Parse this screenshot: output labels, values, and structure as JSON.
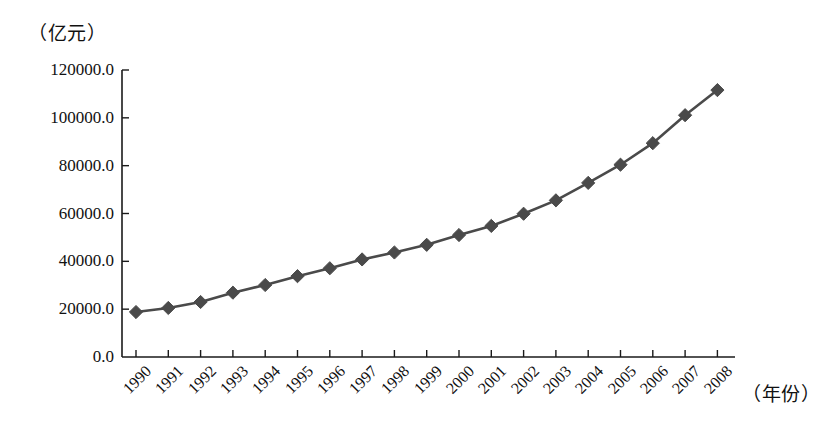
{
  "chart_data": {
    "type": "line",
    "title": "",
    "subtitle": "",
    "xlabel": "（年份）",
    "ylabel": "（亿元）",
    "categories": [
      "1990",
      "1991",
      "1992",
      "1993",
      "1994",
      "1995",
      "1996",
      "1997",
      "1998",
      "1999",
      "2000",
      "2001",
      "2002",
      "2003",
      "2004",
      "2005",
      "2006",
      "2007",
      "2008"
    ],
    "values": [
      18800,
      20500,
      23000,
      26900,
      30100,
      33800,
      37100,
      40800,
      43700,
      46900,
      51000,
      54800,
      59900,
      65500,
      72800,
      80400,
      89400,
      101100,
      111600
    ],
    "series": [
      {
        "name": "",
        "values": [
          18800,
          20500,
          23000,
          26900,
          30100,
          33800,
          37100,
          40800,
          43700,
          46900,
          51000,
          54800,
          59900,
          65500,
          72800,
          80400,
          89400,
          101100,
          111600
        ]
      }
    ],
    "ylim": [
      0,
      120000
    ],
    "ytick_labels": [
      "0.0",
      "20000.0",
      "40000.0",
      "60000.0",
      "80000.0",
      "100000.0",
      "120000.0"
    ],
    "ytick_values": [
      0,
      20000,
      40000,
      60000,
      80000,
      100000,
      120000
    ],
    "xtick_labels": [
      "1990",
      "1991",
      "1992",
      "1993",
      "1994",
      "1995",
      "1996",
      "1997",
      "1998",
      "1999",
      "2000",
      "2001",
      "2002",
      "2003",
      "2004",
      "2005",
      "2006",
      "2007",
      "2008"
    ],
    "grid": false,
    "legend": "none",
    "marker": "diamond",
    "line_color": "#4a4a4a",
    "marker_color": "#4a4a4a",
    "axis_color": "#1a1a1a",
    "background_color": "#ffffff",
    "xtick_rotation": -45
  }
}
